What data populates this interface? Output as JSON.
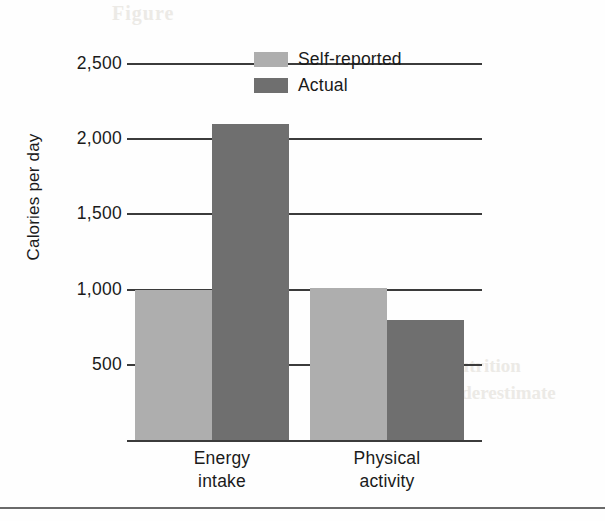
{
  "chart_data": {
    "type": "bar",
    "title": "",
    "xlabel": "",
    "ylabel": "Calories per day",
    "categories": [
      "Energy intake",
      "Physical activity"
    ],
    "category_lines": [
      [
        "Energy",
        "intake"
      ],
      [
        "Physical",
        "activity"
      ]
    ],
    "series": [
      {
        "name": "Self-reported",
        "values": [
          1000,
          1010
        ],
        "color": "#aeaeae"
      },
      {
        "name": "Actual",
        "values": [
          2100,
          800
        ],
        "color": "#6f6f6f"
      }
    ],
    "ylim": [
      0,
      2600
    ],
    "yticks": [
      2500,
      2000,
      1500,
      1000,
      500
    ],
    "ytick_labels": [
      "2,500",
      "2,000",
      "1,500",
      "1,000",
      "500"
    ],
    "grid": "horizontal",
    "legend_position": "top-center"
  },
  "axis": {
    "y_title": "Calories per day",
    "ticks": [
      {
        "label": "2,500",
        "value": 2500
      },
      {
        "label": "2,000",
        "value": 2000
      },
      {
        "label": "1,500",
        "value": 1500
      },
      {
        "label": "1,000",
        "value": 1000
      },
      {
        "label": "500",
        "value": 500
      }
    ]
  },
  "legend": {
    "items": [
      {
        "label": "Self-reported",
        "color": "#aeaeae"
      },
      {
        "label": "Actual",
        "color": "#6f6f6f"
      }
    ]
  },
  "categories": [
    {
      "line1": "Energy",
      "line2": "intake"
    },
    {
      "line1": "Physical",
      "line2": "activity"
    }
  ],
  "ghost_text": {
    "top": "Figure",
    "right_line1": "nutrition",
    "right_line2": "underestimate"
  },
  "colors": {
    "light_gray": "#aeaeae",
    "dark_gray": "#6f6f6f",
    "line": "#3b3b3b",
    "background": "#fefefe"
  }
}
